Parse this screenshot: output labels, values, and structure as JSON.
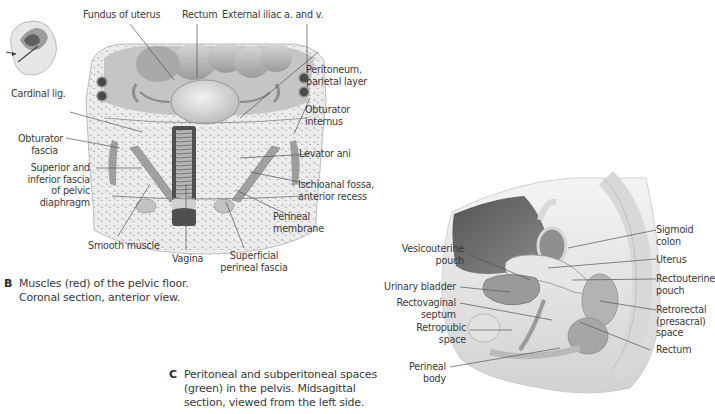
{
  "figure_b": {
    "letter": "B",
    "caption_line1": "Muscles (red) of the pelvic floor.",
    "caption_line2": "Coronal section, anterior view.",
    "labels": {
      "fundus": "Fundus of uterus",
      "rectum": "Rectum",
      "ext_iliac": "External iliac a. and v.",
      "peritoneum_1": "Peritoneum,",
      "peritoneum_2": "parietal layer",
      "cardinal": "Cardinal lig.",
      "obt_internus_1": "Obturator",
      "obt_internus_2": "internus",
      "obt_fascia_1": "Obturator",
      "obt_fascia_2": "fascia",
      "levator": "Levator ani",
      "sup_inf_1": "Superior  and",
      "sup_inf_2": "inferior fascia",
      "sup_inf_3": "of pelvic",
      "sup_inf_4": "diaphragm",
      "ischio_1": "Ischioanal fossa,",
      "ischio_2": "anterior recess",
      "perineal_mem_1": "Perineal",
      "perineal_mem_2": "membrane",
      "smooth": "Smooth muscle",
      "vagina": "Vagina",
      "superficial_1": "Superficial",
      "superficial_2": "perineal fascia"
    }
  },
  "figure_c": {
    "letter": "C",
    "caption_line1": "Peritoneal and subperitoneal spaces",
    "caption_line2": "(green) in the pelvis. Midsagittal",
    "caption_line3": "section, viewed from the left side.",
    "labels": {
      "sigmoid_1": "Sigmoid",
      "sigmoid_2": "colon",
      "vesico_1": "Vesicouterine",
      "vesico_2": "pouch",
      "uterus": "Uterus",
      "bladder": "Urinary bladder",
      "rectoute_1": "Rectouterine",
      "rectoute_2": "pouch",
      "rectovag_1": "Rectovaginal",
      "rectovag_2": "septum",
      "retrorectal_1": "Retrorectal",
      "retrorectal_2": "(presacral)",
      "retrorectal_3": "space",
      "retropubic_1": "Retropubic",
      "retropubic_2": "space",
      "rectum": "Rectum",
      "perineal_body_1": "Perineal",
      "perineal_body_2": "body"
    }
  }
}
